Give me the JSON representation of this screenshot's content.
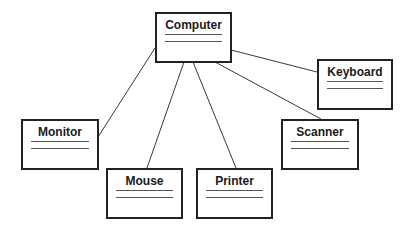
{
  "diagram": {
    "type": "uml-class-diagram",
    "classes": [
      {
        "id": "computer",
        "name": "Computer",
        "x": 155,
        "y": 12,
        "w": 77,
        "h": 51
      },
      {
        "id": "keyboard",
        "name": "Keyboard",
        "x": 317,
        "y": 59,
        "w": 76,
        "h": 51
      },
      {
        "id": "monitor",
        "name": "Monitor",
        "x": 21,
        "y": 119,
        "w": 78,
        "h": 51
      },
      {
        "id": "scanner",
        "name": "Scanner",
        "x": 281,
        "y": 119,
        "w": 78,
        "h": 51
      },
      {
        "id": "mouse",
        "name": "Mouse",
        "x": 106,
        "y": 168,
        "w": 77,
        "h": 51
      },
      {
        "id": "printer",
        "name": "Printer",
        "x": 196,
        "y": 168,
        "w": 77,
        "h": 51
      }
    ],
    "associations": [
      {
        "from": "Computer",
        "to": "Keyboard"
      },
      {
        "from": "Computer",
        "to": "Monitor"
      },
      {
        "from": "Computer",
        "to": "Mouse"
      },
      {
        "from": "Computer",
        "to": "Printer"
      },
      {
        "from": "Computer",
        "to": "Scanner"
      }
    ],
    "colors": {
      "background": "#ffffff",
      "border": "#222222",
      "line": "#3a3a3a",
      "text": "#1a1a1a"
    }
  }
}
